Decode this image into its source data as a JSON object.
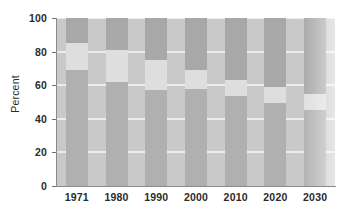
{
  "chart_data": {
    "type": "bar",
    "title": "",
    "subtitle": "",
    "xlabel": "",
    "ylabel": "Percent",
    "stacked": true,
    "stack_total": 100,
    "grid": true,
    "legend": "none",
    "ylim": [
      0,
      100
    ],
    "yticks": [
      0,
      20,
      40,
      60,
      80,
      100
    ],
    "ytick_labels": [
      "0",
      "20",
      "40",
      "60",
      "80",
      "100"
    ],
    "categories": [
      "1971",
      "1980",
      "1990",
      "2000",
      "2010",
      "2020",
      "2030"
    ],
    "series": [
      {
        "name": "bottom-segment",
        "color": "#b0b0b0",
        "values": [
          69,
          62,
          57,
          57.5,
          53.5,
          49.5,
          45
        ]
      },
      {
        "name": "middle-segment",
        "color": "#dedede",
        "values": [
          16,
          19,
          18,
          11.5,
          9.5,
          9.5,
          9.5
        ]
      },
      {
        "name": "top-segment",
        "color": "#a8a8a8",
        "values": [
          15,
          19,
          25,
          31,
          37,
          41,
          45.5
        ]
      }
    ],
    "cumulative_boundaries": [
      {
        "category": "1971",
        "bottom_top": 69,
        "middle_top": 85
      },
      {
        "category": "1980",
        "bottom_top": 62,
        "middle_top": 81
      },
      {
        "category": "1990",
        "bottom_top": 57,
        "middle_top": 75
      },
      {
        "category": "2000",
        "bottom_top": 57.5,
        "middle_top": 69
      },
      {
        "category": "2010",
        "bottom_top": 53.5,
        "middle_top": 63
      },
      {
        "category": "2020",
        "bottom_top": 49.5,
        "middle_top": 59
      },
      {
        "category": "2030",
        "bottom_top": 45,
        "middle_top": 54.5
      }
    ],
    "colors": {
      "plot_background": "#c9c9c9",
      "gridline": "#f2f2f2",
      "axis": "#8a8a8a",
      "text": "#2b2b2b"
    }
  }
}
